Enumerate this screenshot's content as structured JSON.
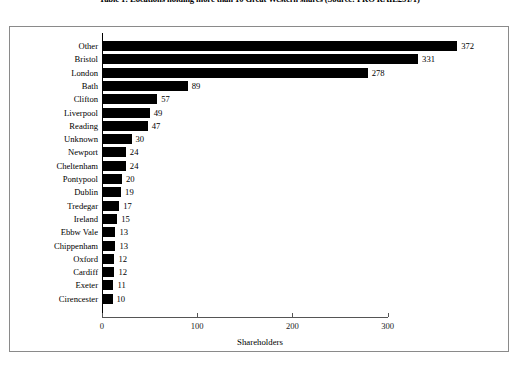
{
  "caption": "Table 1: Locations holding more than 10 Great Western shares (Source: PRO RAIL251/1)",
  "chart_data": {
    "type": "bar",
    "orientation": "horizontal",
    "title": "",
    "xlabel": "Shareholders",
    "ylabel": "",
    "xlim": [
      0,
      300
    ],
    "xticks": [
      0,
      100,
      200,
      300
    ],
    "grid": false,
    "legend": null,
    "bar_color": "#000000",
    "categories": [
      "Other",
      "Bristol",
      "London",
      "Bath",
      "Clifton",
      "Liverpool",
      "Reading",
      "Unknown",
      "Newport",
      "Cheltenham",
      "Pontypool",
      "Dublin",
      "Tredegar",
      "Ireland",
      "Ebbw Vale",
      "Chippenham",
      "Oxford",
      "Cardiff",
      "Exeter",
      "Cirencester"
    ],
    "values": [
      372,
      331,
      278,
      89,
      57,
      49,
      47,
      30,
      24,
      24,
      20,
      19,
      17,
      15,
      13,
      13,
      12,
      12,
      11,
      10
    ]
  }
}
